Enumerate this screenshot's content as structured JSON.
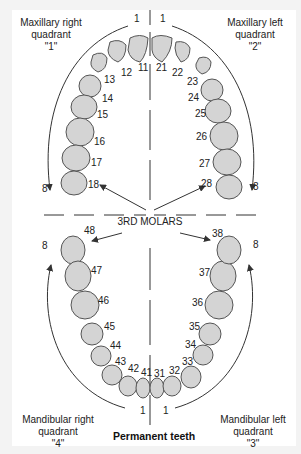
{
  "title": "Permanent teeth",
  "center_label": "3RD MOLARS",
  "quadrants": {
    "upper_right": {
      "line1": "Maxillary right",
      "line2": "quadrant",
      "line3": "\"1\""
    },
    "upper_left": {
      "line1": "Maxillary left",
      "line2": "quadrant",
      "line3": "\"2\""
    },
    "lower_right": {
      "line1": "Mandibular right",
      "line2": "quadrant",
      "line3": "\"4\""
    },
    "lower_left": {
      "line1": "Mandibular left",
      "line2": "quadrant",
      "line3": "\"3\""
    }
  },
  "arch_end_labels": {
    "upper_start_left": "1",
    "upper_start_right": "1",
    "upper_end_left": "8",
    "upper_end_right": "8",
    "lower_end_left": "8",
    "lower_end_right": "8",
    "lower_start_left": "1",
    "lower_start_right": "1"
  },
  "teeth": {
    "upper_right": [
      "11",
      "12",
      "13",
      "14",
      "15",
      "16",
      "17",
      "18"
    ],
    "upper_left": [
      "21",
      "22",
      "23",
      "24",
      "25",
      "26",
      "27",
      "28"
    ],
    "lower_left": [
      "31",
      "32",
      "33",
      "34",
      "35",
      "36",
      "37",
      "38"
    ],
    "lower_right": [
      "41",
      "42",
      "43",
      "44",
      "45",
      "46",
      "47",
      "48"
    ]
  },
  "colors": {
    "tooth_fill": "#d4d4d4",
    "tooth_stroke": "#555555",
    "line": "#333333",
    "background": "#f3f3f3",
    "panel": "#ffffff"
  }
}
